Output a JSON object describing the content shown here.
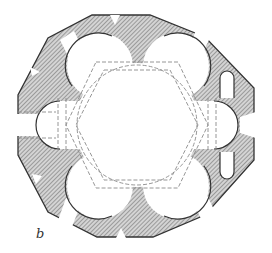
{
  "figure": {
    "label": "b",
    "type": "architectural floor plan"
  },
  "colors": {
    "wall_fill": "#bdbdbd",
    "hatch": "#6a6a6a",
    "outline": "#333333",
    "dashed": "#8a8a8a",
    "background": "#ffffff"
  }
}
